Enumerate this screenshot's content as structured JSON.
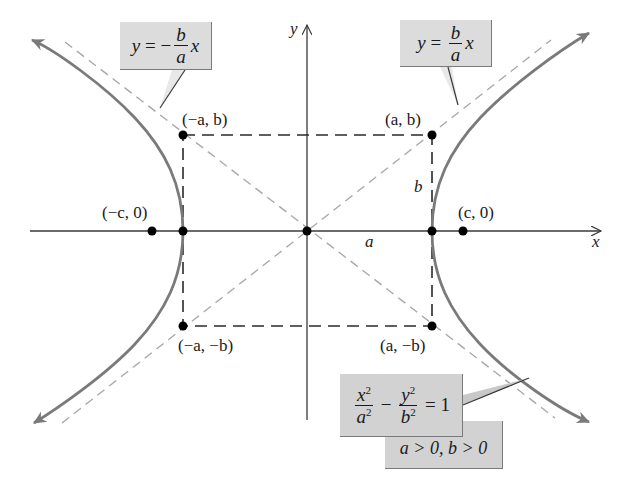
{
  "diagram": {
    "colors": {
      "curve": "#7a7a7a",
      "asymptote": "#a8a8a8",
      "axes": "#3a3a3a",
      "rectangle": "#2a2a2a",
      "points": "#000000",
      "callout_bg": "#dcdcdc"
    },
    "axes": {
      "x_label": "x",
      "y_label": "y"
    },
    "points": {
      "neg_a_b": "(−a, b)",
      "a_b": "(a, b)",
      "neg_c_0": "(−c, 0)",
      "c_0": "(c, 0)",
      "neg_a_neg_b": "(−a, −b)",
      "a_neg_b": "(a, −b)"
    },
    "segment_labels": {
      "a": "a",
      "b": "b"
    },
    "callouts": {
      "neg_asymptote": {
        "lhs": "y",
        "eq": " = −",
        "num": "b",
        "den": "a",
        "var": "x"
      },
      "pos_asymptote": {
        "lhs": "y",
        "eq": " = ",
        "num": "b",
        "den": "a",
        "var": "x"
      },
      "equation": {
        "t1_num": "x",
        "t1_num_exp": "2",
        "t1_den": "a",
        "t1_den_exp": "2",
        "minus": " − ",
        "t2_num": "y",
        "t2_num_exp": "2",
        "t2_den": "b",
        "t2_den_exp": "2",
        "rhs": " = 1"
      },
      "conditions": "a > 0, b > 0"
    }
  }
}
